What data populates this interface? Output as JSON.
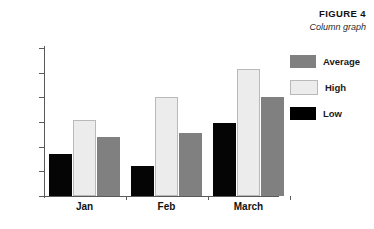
{
  "figure": {
    "number": "FIGURE 4",
    "subtitle": "Column graph"
  },
  "legend": {
    "position": "right",
    "entries": [
      {
        "label": "Average",
        "color": "#808080"
      },
      {
        "label": "High",
        "color": "#ececec"
      },
      {
        "label": "Low",
        "color": "#000000"
      }
    ]
  },
  "chart_data": {
    "type": "bar",
    "title": "FIGURE 4",
    "subtitle": "Column graph",
    "xlabel": "",
    "ylabel": "",
    "categories": [
      "Jan",
      "Feb",
      "March"
    ],
    "series": [
      {
        "name": "Low",
        "color": "#000000",
        "values": [
          17,
          12,
          29.5
        ]
      },
      {
        "name": "High",
        "color": "#ececec",
        "values": [
          31,
          40,
          51.5
        ]
      },
      {
        "name": "Average",
        "color": "#808080",
        "values": [
          24,
          25.5,
          40
        ]
      }
    ],
    "series_draw_order": [
      "Low",
      "High",
      "Average"
    ],
    "legend_order": [
      "Average",
      "High",
      "Low"
    ],
    "ylim": [
      0,
      60
    ],
    "ytick_step": 10,
    "yticks": [
      0,
      10,
      20,
      30,
      40,
      50,
      60
    ],
    "ytick_labels": [
      "0",
      "10",
      "20",
      "30",
      "40",
      "50",
      "60"
    ],
    "grid": false,
    "legend_position": "right"
  }
}
